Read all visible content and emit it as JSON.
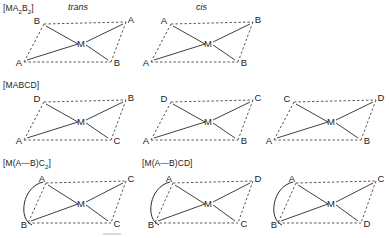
{
  "page": {
    "background": "#ffffff",
    "ink": "#1b1b1b",
    "bond_color": "#2a2a2a",
    "edge_color": "#3a3a3a"
  },
  "rows": [
    {
      "id": "MA2B2",
      "formula_text": "[MA",
      "formula": {
        "prefix": "[MA",
        "sub1": "2",
        "mid": "B",
        "sub2": "2",
        "suffix": "]"
      },
      "diagrams": [
        {
          "name": "trans",
          "isomer_label": "trans",
          "vertices": {
            "top_left": "B",
            "top_right": "A",
            "bottom_left": "A",
            "bottom_right": "B"
          },
          "center": "M",
          "chelate": false
        },
        {
          "name": "cis",
          "isomer_label": "cis",
          "vertices": {
            "top_left": "A",
            "top_right": "B",
            "bottom_left": "A",
            "bottom_right": "B"
          },
          "center": "M",
          "chelate": false
        }
      ]
    },
    {
      "id": "MABCD",
      "formula": {
        "prefix": "[MABCD",
        "sub1": "",
        "mid": "",
        "sub2": "",
        "suffix": "]"
      },
      "formula_text": "[MABCD]",
      "diagrams": [
        {
          "name": "mabcd-1",
          "isomer_label": "",
          "vertices": {
            "top_left": "D",
            "top_right": "B",
            "bottom_left": "A",
            "bottom_right": "C"
          },
          "center": "M",
          "chelate": false
        },
        {
          "name": "mabcd-2",
          "isomer_label": "",
          "vertices": {
            "top_left": "D",
            "top_right": "C",
            "bottom_left": "A",
            "bottom_right": "B"
          },
          "center": "M",
          "chelate": false
        },
        {
          "name": "mabcd-3",
          "isomer_label": "",
          "vertices": {
            "top_left": "C",
            "top_right": "D",
            "bottom_left": "A",
            "bottom_right": "B"
          },
          "center": "M",
          "chelate": false
        }
      ]
    },
    {
      "id": "chelates",
      "formula": {
        "prefix": "[M(A",
        "dash": "—",
        "mid": "B)C",
        "sub2": "2",
        "suffix": "]"
      },
      "formula_text": "[M(A—B)C2]",
      "diagrams": [
        {
          "name": "chelate-1",
          "isomer_label": "",
          "formula_above": "[M(A—B)C2]",
          "vertices": {
            "top_left": "A",
            "top_right": "C",
            "bottom_left": "B",
            "bottom_right": "C"
          },
          "center": "M",
          "chelate": true
        },
        {
          "name": "chelate-2",
          "isomer_label": "",
          "formula_above": "[M(A—B)CD]",
          "vertices": {
            "top_left": "A",
            "top_right": "D",
            "bottom_left": "B",
            "bottom_right": "C"
          },
          "center": "M",
          "chelate": true
        },
        {
          "name": "chelate-3",
          "isomer_label": "",
          "formula_above": "",
          "vertices": {
            "top_left": "A",
            "top_right": "C",
            "bottom_left": "B",
            "bottom_right": "D"
          },
          "center": "M",
          "chelate": true
        }
      ]
    }
  ],
  "formulas": {
    "ma2b2_prefix": "[MA",
    "ma2b2_sub1": "2",
    "ma2b2_mid": "B",
    "ma2b2_sub2": "2",
    "ma2b2_suffix": "]",
    "mabcd": "[MABCD]",
    "chelate_c2_prefix": "[M(A—B)C",
    "chelate_c2_sub": "2",
    "chelate_c2_suffix": "]",
    "chelate_cd": "[M(A—B)CD]"
  }
}
